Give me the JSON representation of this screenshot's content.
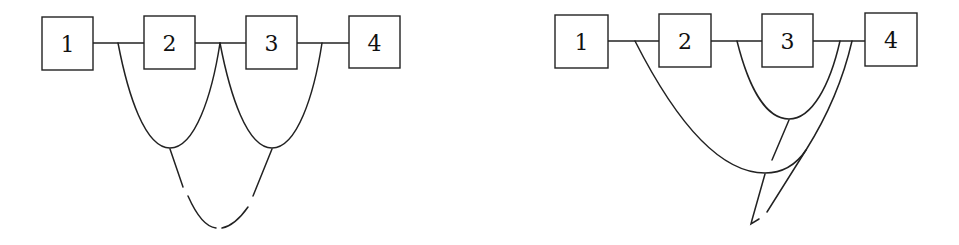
{
  "diagrams": [
    {
      "name": "left-diagram",
      "nodes": [
        {
          "label": "1",
          "x": 42,
          "y": 17,
          "w": 51,
          "h": 53
        },
        {
          "label": "2",
          "x": 144,
          "y": 16,
          "w": 51,
          "h": 53
        },
        {
          "label": "3",
          "x": 246,
          "y": 16,
          "w": 51,
          "h": 53
        },
        {
          "label": "4",
          "x": 349,
          "y": 16,
          "w": 51,
          "h": 52
        }
      ]
    },
    {
      "name": "right-diagram",
      "nodes": [
        {
          "label": "1",
          "x": 555,
          "y": 15,
          "w": 53,
          "h": 53
        },
        {
          "label": "2",
          "x": 659,
          "y": 14,
          "w": 52,
          "h": 53
        },
        {
          "label": "3",
          "x": 762,
          "y": 14,
          "w": 51,
          "h": 53
        },
        {
          "label": "4",
          "x": 865,
          "y": 13,
          "w": 52,
          "h": 53
        }
      ]
    }
  ],
  "colors": {
    "stroke": "#222222",
    "background": "#ffffff"
  }
}
